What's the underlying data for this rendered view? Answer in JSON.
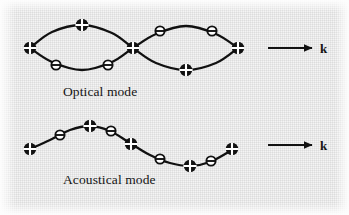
{
  "figure": {
    "background_color": "#f4f4f4",
    "ink_color": "#111111"
  },
  "labels": {
    "optical_mode": "Optical mode",
    "acoustical_mode": "Acoustical mode",
    "wavevector_top": "k",
    "wavevector_bottom": "k"
  },
  "legend": {
    "marker_a_name": "filled-circle-with-cross",
    "marker_b_name": "open-circle-with-bar"
  },
  "chart_data": {
    "type": "line",
    "xlabel": "",
    "ylabel": "",
    "grid": false,
    "legend_position": "none",
    "panels": [
      {
        "name": "optical",
        "label": "Optical mode",
        "arrow_label": "k",
        "description": "Two sublattices vibrating out of phase, curves cross at the chain midpoint forming a bowtie",
        "series": [
          {
            "name": "sublattice-upper",
            "path": [
              {
                "x": 30,
                "y": 48
              },
              {
                "x": 52,
                "y": 32
              },
              {
                "x": 82,
                "y": 25
              },
              {
                "x": 112,
                "y": 33
              },
              {
                "x": 133,
                "y": 48
              },
              {
                "x": 156,
                "y": 63
              },
              {
                "x": 186,
                "y": 70
              },
              {
                "x": 216,
                "y": 63
              },
              {
                "x": 238,
                "y": 48
              }
            ]
          },
          {
            "name": "sublattice-lower",
            "path": [
              {
                "x": 30,
                "y": 48
              },
              {
                "x": 52,
                "y": 62
              },
              {
                "x": 82,
                "y": 70
              },
              {
                "x": 112,
                "y": 62
              },
              {
                "x": 133,
                "y": 48
              },
              {
                "x": 156,
                "y": 34
              },
              {
                "x": 186,
                "y": 26
              },
              {
                "x": 216,
                "y": 34
              },
              {
                "x": 238,
                "y": 48
              }
            ]
          }
        ],
        "markers": [
          {
            "x": 30,
            "y": 48,
            "type": "filled-cross"
          },
          {
            "x": 82,
            "y": 25,
            "type": "filled-cross"
          },
          {
            "x": 133,
            "y": 48,
            "type": "filled-cross"
          },
          {
            "x": 186,
            "y": 70,
            "type": "filled-cross"
          },
          {
            "x": 238,
            "y": 48,
            "type": "filled-cross"
          },
          {
            "x": 56,
            "y": 65,
            "type": "open-bar"
          },
          {
            "x": 108,
            "y": 65,
            "type": "open-bar"
          },
          {
            "x": 160,
            "y": 31,
            "type": "open-bar"
          },
          {
            "x": 212,
            "y": 31,
            "type": "open-bar"
          }
        ]
      },
      {
        "name": "acoustical",
        "label": "Acoustical mode",
        "arrow_label": "k",
        "description": "Both sublattices vibrating in phase along a single sinusoid",
        "series": [
          {
            "name": "chain",
            "path": [
              {
                "x": 30,
                "y": 149
              },
              {
                "x": 50,
                "y": 140
              },
              {
                "x": 70,
                "y": 130
              },
              {
                "x": 90,
                "y": 126
              },
              {
                "x": 110,
                "y": 131
              },
              {
                "x": 130,
                "y": 143
              },
              {
                "x": 150,
                "y": 155
              },
              {
                "x": 170,
                "y": 163
              },
              {
                "x": 190,
                "y": 166
              },
              {
                "x": 210,
                "y": 162
              },
              {
                "x": 232,
                "y": 150
              }
            ]
          }
        ],
        "markers": [
          {
            "x": 30,
            "y": 149,
            "type": "filled-cross"
          },
          {
            "x": 90,
            "y": 126,
            "type": "filled-cross"
          },
          {
            "x": 131,
            "y": 144,
            "type": "filled-cross"
          },
          {
            "x": 190,
            "y": 166,
            "type": "filled-cross"
          },
          {
            "x": 232,
            "y": 149,
            "type": "filled-cross"
          },
          {
            "x": 60,
            "y": 135,
            "type": "open-bar"
          },
          {
            "x": 111,
            "y": 131,
            "type": "open-bar"
          },
          {
            "x": 160,
            "y": 159,
            "type": "open-bar"
          },
          {
            "x": 211,
            "y": 161,
            "type": "open-bar"
          }
        ]
      }
    ],
    "arrows": [
      {
        "name": "k-arrow-top",
        "x1": 268,
        "y1": 48,
        "x2": 312,
        "y2": 48,
        "label": "k"
      },
      {
        "name": "k-arrow-bottom",
        "x1": 268,
        "y1": 145,
        "x2": 312,
        "y2": 145,
        "label": "k"
      }
    ]
  }
}
